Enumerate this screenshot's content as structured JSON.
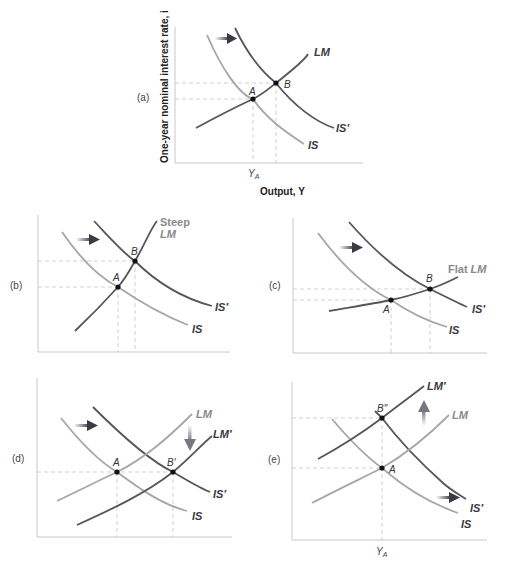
{
  "colors": {
    "dark_curve": "#55555f",
    "light_curve": "#a6a6a6",
    "axis": "#c8c8c8",
    "guide": "#c4c4c4",
    "point": "#111111"
  },
  "axes": {
    "y_title": "One-year nominal interest rate, i",
    "x_title": "Output, Y",
    "ya_label": "Y",
    "ya_sub": "A"
  },
  "panels": {
    "a": {
      "label": "(a)",
      "curves": {
        "lm": "LM",
        "is": "IS",
        "is_prime": "IS′"
      },
      "points": {
        "a": "A",
        "b": "B"
      },
      "shift": "IS shifts right"
    },
    "b": {
      "label": "(b)",
      "curves": {
        "lm_line1": "Steep",
        "lm_line2": "LM",
        "is": "IS",
        "is_prime": "IS′"
      },
      "points": {
        "a": "A",
        "b": "B"
      },
      "shift": "IS shifts right"
    },
    "c": {
      "label": "(c)",
      "curves": {
        "lm_prefix": "Flat",
        "lm": "LM",
        "is": "IS",
        "is_prime": "IS′"
      },
      "points": {
        "a": "A",
        "b": "B"
      },
      "shift": "IS shifts right"
    },
    "d": {
      "label": "(d)",
      "curves": {
        "lm": "LM",
        "lm_prime": "LM′",
        "is": "IS",
        "is_prime": "IS′"
      },
      "points": {
        "a": "A",
        "b_prime": "B′"
      },
      "shifts": [
        "IS shifts right",
        "LM shifts down"
      ]
    },
    "e": {
      "label": "(e)",
      "curves": {
        "lm": "LM",
        "lm_prime": "LM′",
        "is": "IS",
        "is_prime": "IS′"
      },
      "points": {
        "a": "A",
        "b_double_prime": "B″"
      },
      "shifts": [
        "IS shifts right",
        "LM shifts up"
      ]
    }
  }
}
